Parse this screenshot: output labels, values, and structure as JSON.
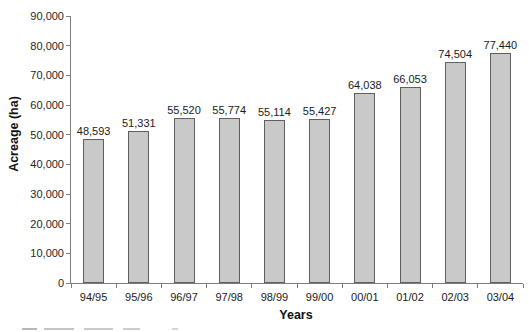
{
  "chart_data": {
    "type": "bar",
    "title": "",
    "xlabel": "Years",
    "ylabel": "Acreage (ha)",
    "categories": [
      "94/95",
      "95/96",
      "96/97",
      "97/98",
      "98/99",
      "99/00",
      "00/01",
      "01/02",
      "02/03",
      "03/04"
    ],
    "values": [
      48593,
      51331,
      55520,
      55774,
      55114,
      55427,
      64038,
      66053,
      74504,
      77440
    ],
    "value_labels": [
      "48,593",
      "51,331",
      "55,520",
      "55,774",
      "55,114",
      "55,427",
      "64,038",
      "66,053",
      "74,504",
      "77,440"
    ],
    "ylim": [
      0,
      90000
    ],
    "ytick_step": 10000,
    "ytick_labels": [
      "0",
      "10,000",
      "20,000",
      "30,000",
      "40,000",
      "50,000",
      "60,000",
      "70,000",
      "80,000",
      "90,000"
    ],
    "grid": "off",
    "legend": "none",
    "colors": {
      "bar_fill": "#c9c9c9",
      "bar_border": "#5f5f5f",
      "axis": "#7d7d7d",
      "text": "#1a1a1a",
      "background": "#ffffff"
    }
  }
}
